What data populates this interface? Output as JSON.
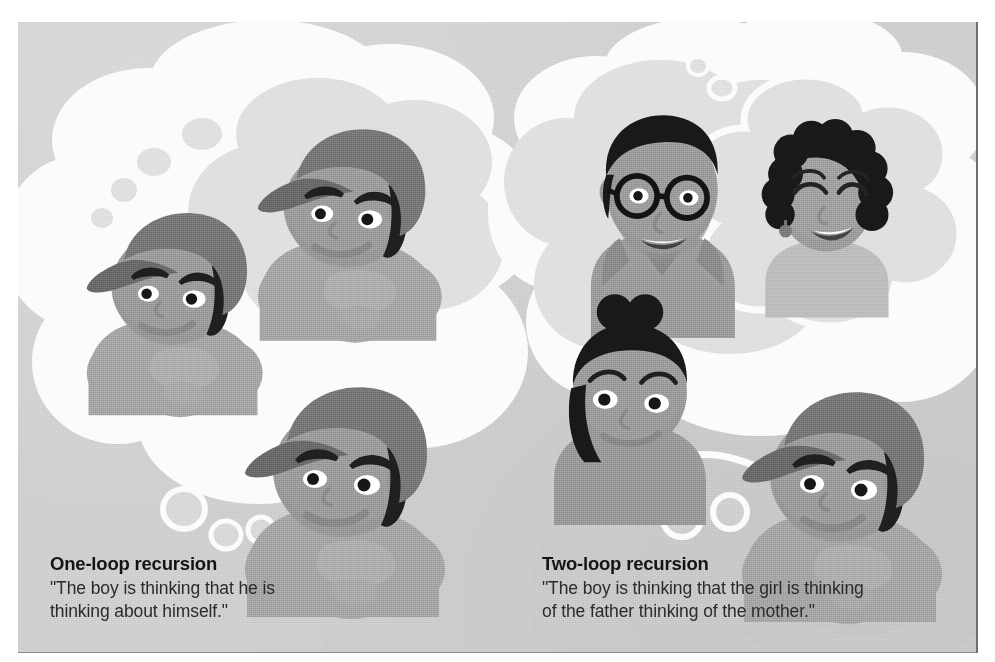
{
  "figure": {
    "type": "illustration",
    "palette": {
      "paper": "#c9c9c9",
      "bubble_white": "#fbfbfb",
      "bubble_inner": "#dcdcdc",
      "skin": "#8f8f8f",
      "skin_shadow": "#7e7e7e",
      "cap": "#6b6b6b",
      "hair_dark": "#1c1c1c",
      "shirt": "#9a9a9a",
      "text": "#1b1b1b"
    }
  },
  "panels": [
    {
      "id": "one-loop",
      "title": "One-loop recursion",
      "quote": "\"The boy is thinking that he is\nthinking about himself.\"",
      "characters": [
        "boy",
        "boy",
        "boy"
      ],
      "nesting_depth": 2
    },
    {
      "id": "two-loop",
      "title": "Two-loop recursion",
      "quote": "\"The boy is thinking that the girl is thinking\nof the father thinking of the mother.\"",
      "characters": [
        "boy",
        "girl",
        "father",
        "mother"
      ],
      "nesting_depth": 3
    }
  ]
}
